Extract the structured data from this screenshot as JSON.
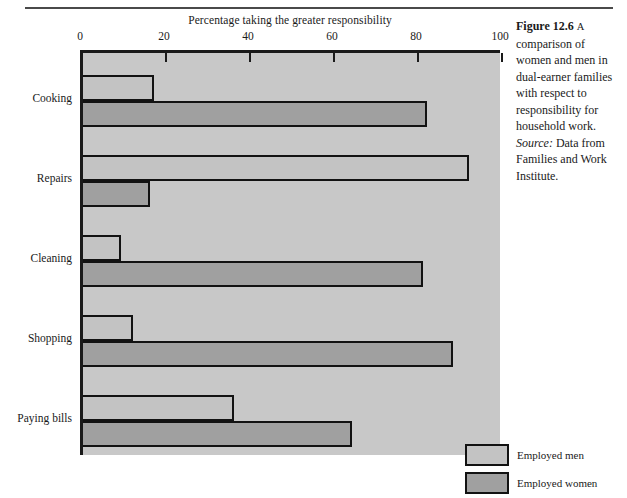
{
  "figure": {
    "number_label": "Figure 12.6",
    "lead_letter": "A",
    "caption_text": "comparison of women and men in dual-earner families with respect to responsibility for household work.",
    "source_label": "Source:",
    "source_text": "Data from Families and Work Institute."
  },
  "legend": {
    "position": "inside-bottom-right",
    "items": [
      {
        "label": "Employed men",
        "color": "#c3c3c3",
        "swatch": "men"
      },
      {
        "label": "Employed women",
        "color": "#a0a0a0",
        "swatch": "women"
      }
    ]
  },
  "colors": {
    "plot_background": "#c8c8c8",
    "axis": "#1a1a1a",
    "men_bar": "#c3c3c3",
    "women_bar": "#a0a0a0",
    "bar_outline": "#121212",
    "page_background": "#ffffff"
  },
  "chart_data": {
    "type": "bar",
    "orientation": "horizontal",
    "title": "Percentage taking the greater responsibility",
    "xlabel": "",
    "ylabel": "",
    "xlim": [
      0,
      100
    ],
    "xticks": [
      0,
      20,
      40,
      60,
      80,
      100
    ],
    "xticklabels": [
      "0",
      "20",
      "40",
      "60",
      "80",
      "100"
    ],
    "grid": false,
    "categories": [
      "Cooking",
      "Repairs",
      "Cleaning",
      "Shopping",
      "Paying bills"
    ],
    "series": [
      {
        "name": "Employed men",
        "values": [
          17,
          92,
          9,
          12,
          36
        ]
      },
      {
        "name": "Employed women",
        "values": [
          82,
          16,
          81,
          88,
          64
        ]
      }
    ]
  }
}
